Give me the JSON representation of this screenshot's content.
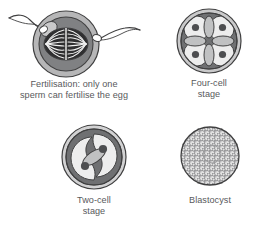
{
  "figure": {
    "background_color": "#ffffff",
    "text_color": "#58595b"
  },
  "palette": {
    "outline": "#404041",
    "zona_ring": "#a7a7a8",
    "cytoplasm_dark": "#808183",
    "cell_light": "#e8e8e8",
    "cell_mid": "#c9c9ca",
    "nucleus_dark": "#58595b",
    "spindle_dark": "#3b3b3d",
    "sperm_head": "#ffffff",
    "stipple": "#6d6e70"
  },
  "panels": [
    {
      "id": "fertilisation",
      "art_name": "fertilisation-diagram",
      "caption_lines": [
        "Fertilisation: only one",
        "sperm can fertilise the egg"
      ],
      "elements": [
        "zona-pellucida-ring",
        "cytoplasm",
        "meiotic-spindle",
        "fertilising-sperm-head",
        "fertilising-sperm-tail",
        "blocked-sperm-head",
        "blocked-sperm-tail",
        "polar-body"
      ],
      "sperm_count": 2,
      "cell_count": 1
    },
    {
      "id": "four-cell",
      "art_name": "four-cell-stage-diagram",
      "caption_lines": [
        "Four-cell",
        "stage"
      ],
      "elements": [
        "zona-pellucida-ring",
        "blastomere-top-left",
        "blastomere-top-right",
        "blastomere-bottom-left",
        "blastomere-bottom-right",
        "cleavage-furrows"
      ],
      "cell_count": 4
    },
    {
      "id": "two-cell",
      "art_name": "two-cell-stage-diagram",
      "caption_lines": [
        "Two-cell",
        "stage"
      ],
      "elements": [
        "zona-pellucida-ring",
        "blastomere-upper",
        "blastomere-lower",
        "cleavage-furrow"
      ],
      "cell_count": 2
    },
    {
      "id": "blastocyst",
      "art_name": "blastocyst-diagram",
      "caption_lines": [
        "Blastocyst"
      ],
      "elements": [
        "zona-pellucida-fragments",
        "trophoblast-cell-mass",
        "inner-cavity"
      ],
      "cell_count": "many"
    }
  ]
}
